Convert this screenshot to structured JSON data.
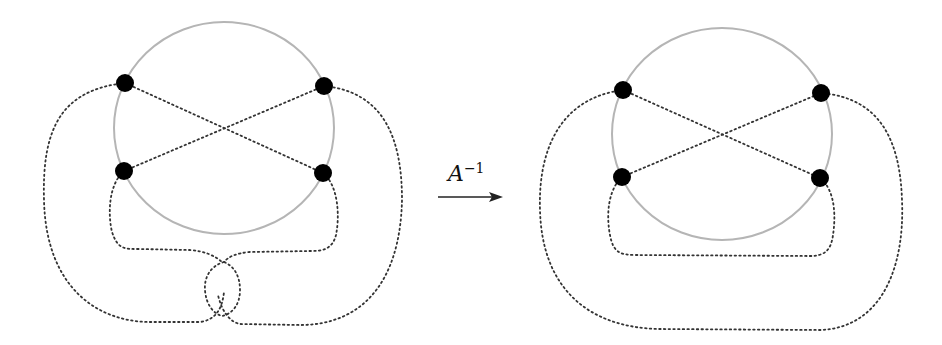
{
  "diagram": {
    "arrow_label": {
      "base": "A",
      "exponent": "−1"
    },
    "colors": {
      "circle": "#b5b5b5",
      "node": "#000000",
      "dotted": "#333333",
      "arrow": "#222222"
    },
    "left_figure": {
      "description": "Circle with 4 nodes, crossing chords, outer arcs forming a twisted loop at bottom",
      "nodes": 4
    },
    "right_figure": {
      "description": "Circle with 4 nodes, crossing chords, outer arcs untwisted",
      "nodes": 4
    }
  }
}
